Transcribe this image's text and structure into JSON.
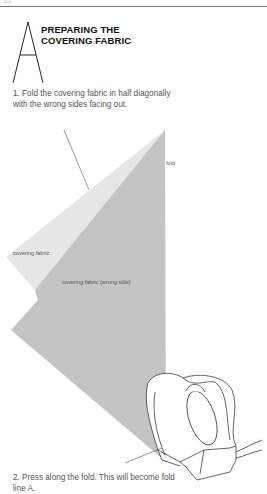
{
  "page": {
    "page_number": "103",
    "section_letter": "A",
    "title_lines": [
      "PREPARING THE",
      "COVERING FABRIC"
    ]
  },
  "steps": [
    {
      "text": "1. Fold the covering fabric in half diagonally with the wrong sides facing out."
    },
    {
      "text": "2. Press along the fold. This will become fold line A."
    }
  ],
  "illustration": {
    "labels": {
      "fold": "fold",
      "covering_fabric": "covering fabric",
      "covering_fabric_wrong_side": "covering fabric (wrong side)"
    },
    "colors": {
      "light_fabric": "#e6e6e6",
      "dark_fabric": "#c4c4c4",
      "line": "#555555"
    }
  }
}
